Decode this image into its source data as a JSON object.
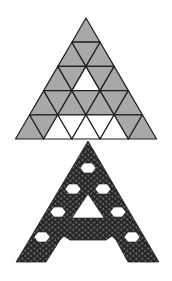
{
  "figure": {
    "colors": {
      "background": "#ffffff",
      "tile_fill": "#a8a8a8",
      "tile_empty": "#ffffff",
      "grid_line": "#1e1e1e",
      "fractal_dark": "#2a2a2a",
      "fractal_dot": "#8c8c8c"
    },
    "top_triangle": {
      "rows": 5,
      "apex": [
        86,
        18
      ],
      "base_y": 139,
      "base_x": [
        16,
        157
      ],
      "white_cells": [
        {
          "row": 3,
          "index": 3
        },
        {
          "row": 5,
          "index": 3
        },
        {
          "row": 5,
          "index": 4
        },
        {
          "row": 5,
          "index": 5
        },
        {
          "row": 5,
          "index": 6
        },
        {
          "row": 5,
          "index": 7
        }
      ]
    },
    "bottom_fractal": {
      "apex": [
        88,
        141
      ],
      "base_y": 262,
      "hex_holes": [
        [
          88,
          168
        ],
        [
          73,
          189
        ],
        [
          103,
          189
        ],
        [
          58,
          212
        ],
        [
          118,
          212
        ],
        [
          42,
          237
        ],
        [
          132,
          237
        ]
      ],
      "triangle_hole": [
        [
          88,
          194
        ],
        [
          72,
          218
        ],
        [
          104,
          218
        ]
      ]
    }
  }
}
